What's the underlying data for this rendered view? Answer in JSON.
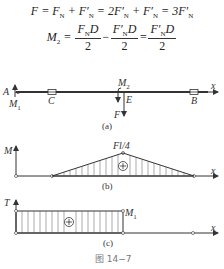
{
  "equations": {
    "line1": {
      "lhs": "F",
      "terms": [
        "F",
        "N",
        "F′",
        "N",
        "2F′",
        "N",
        "F′",
        "N",
        "3F′",
        "N"
      ]
    },
    "line2": {
      "lhs": "M",
      "lhs_sub": "2",
      "frac1_num": "F",
      "frac1_num_sub": "N",
      "frac1_num_tail": "D",
      "frac2_num": "F′",
      "frac2_num_sub": "N",
      "frac2_num_tail": "D",
      "frac3_num": "F′",
      "frac3_num_sub": "N",
      "frac3_num_tail": "D",
      "den": "2"
    }
  },
  "figure_a": {
    "labels": {
      "A": "A",
      "M1": "M",
      "M1_sub": "1",
      "C": "C",
      "M2": "M",
      "M2_sub": "2",
      "E": "E",
      "F": "F",
      "B": "B",
      "x": "x"
    },
    "caption": "(a)"
  },
  "figure_b": {
    "axis_y": "M",
    "axis_x": "x",
    "peak_label": "Fl/4",
    "sign": "+",
    "caption": "(b)"
  },
  "figure_c": {
    "axis_y": "T",
    "axis_x": "x",
    "value_label": "M",
    "value_label_sub": "1",
    "sign": "+",
    "caption": "(c)"
  },
  "figure_caption": "图 14−7"
}
